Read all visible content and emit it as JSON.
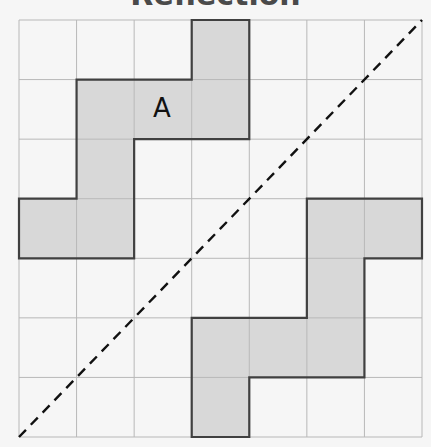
{
  "title": "Reflection",
  "grid": {
    "cols": 7,
    "rows": 7,
    "left": 19,
    "top": 20,
    "right": 422,
    "bottom": 437,
    "line_color": "#b8b8b8",
    "background": "#f6f6f6"
  },
  "shapes": [
    {
      "id": "A",
      "label": "A",
      "label_cell": [
        2,
        1
      ],
      "cells": [
        [
          3,
          0
        ],
        [
          1,
          1
        ],
        [
          2,
          1
        ],
        [
          3,
          1
        ],
        [
          1,
          2
        ],
        [
          0,
          3
        ],
        [
          1,
          3
        ]
      ],
      "outline": [
        [
          3,
          0
        ],
        [
          4,
          0
        ],
        [
          4,
          2
        ],
        [
          2,
          2
        ],
        [
          2,
          4
        ],
        [
          0,
          4
        ],
        [
          0,
          3
        ],
        [
          1,
          3
        ],
        [
          1,
          1
        ],
        [
          3,
          1
        ]
      ],
      "fill": "#d8d8d8",
      "stroke": "#404040"
    },
    {
      "id": "B",
      "label": "",
      "cells": [
        [
          5,
          3
        ],
        [
          6,
          3
        ],
        [
          5,
          4
        ],
        [
          3,
          5
        ],
        [
          4,
          5
        ],
        [
          5,
          5
        ],
        [
          3,
          6
        ]
      ],
      "outline": [
        [
          5,
          3
        ],
        [
          7,
          3
        ],
        [
          7,
          4
        ],
        [
          6,
          4
        ],
        [
          6,
          6
        ],
        [
          4,
          6
        ],
        [
          4,
          7
        ],
        [
          3,
          7
        ],
        [
          3,
          5
        ],
        [
          5,
          5
        ]
      ],
      "fill": "#d8d8d8",
      "stroke": "#404040"
    }
  ],
  "mirror_line": {
    "from": [
      0,
      7
    ],
    "to": [
      7,
      0
    ],
    "style": "dashed",
    "color": "#111111"
  }
}
